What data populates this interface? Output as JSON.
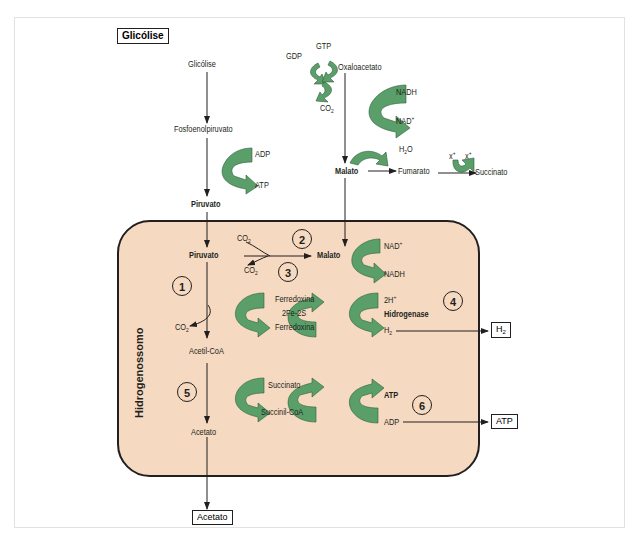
{
  "title_box": "Glicólise",
  "compartment": {
    "name": "Hidrogenossomo",
    "fill": "#f5d9c0",
    "stroke": "#231f20"
  },
  "arrow_color": "#5a9e69",
  "outside": {
    "glicolise": "Glicólise",
    "fosfoenolpiruvato": "Fosfoenolpiruvato",
    "adp_1": "ADP",
    "atp_1": "ATP",
    "piruvato_out": "Piruvato",
    "gtp": "GTP",
    "gdp": "GDP",
    "oxaloacetato": "Oxaloacetato",
    "co2_top": "CO2",
    "nadh_top": "NADH",
    "nad_top": "NAD+",
    "h2o": "H2O",
    "malato_out": "Malato",
    "fumarato": "Fumarato",
    "x1": "x+",
    "x2": "x+",
    "succinato_out": "Succinato"
  },
  "inside": {
    "piruvato": "Piruvato",
    "malato": "Malato",
    "co2_in": "CO2",
    "co2_out": "CO2",
    "nad_plus": "NAD+",
    "nadh": "NADH",
    "ferredoxina_1": "Ferredoxina",
    "fe2s": "2Fe-2S",
    "ferredoxina_2": "Ferredoxina",
    "two_h": "2H+",
    "hidrogenase": "Hidrogenase",
    "h2": "H2",
    "co2_acetil": "CO2",
    "acetil_coa": "Acetil-CoA",
    "succinato": "Succinato",
    "succinil_coa": "Succinil-CoA",
    "atp": "ATP",
    "adp": "ADP",
    "acetato": "Acetato"
  },
  "steps": [
    "1",
    "2",
    "3",
    "4",
    "5",
    "6"
  ],
  "products": {
    "h2": "H2",
    "atp": "ATP",
    "acetato": "Acetato"
  }
}
